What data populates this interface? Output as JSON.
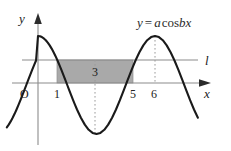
{
  "figure": {
    "title_equation": {
      "lhs": "y",
      "equals": "=",
      "amplitude": "a",
      "function": "cos",
      "frequency": "b",
      "variable": "x",
      "full": "y = a cos bx"
    },
    "axes": {
      "y_axis_label": "y",
      "x_axis_label": "x",
      "origin_label": "O"
    },
    "line_label": "l",
    "tick_labels": [
      {
        "text": "1",
        "x_value": 1
      },
      {
        "text": "5",
        "x_value": 5
      },
      {
        "text": "6",
        "x_value": 6
      }
    ],
    "shaded_region": {
      "value_label": "3",
      "from_x": 1,
      "to_x": 5,
      "fill_color": "#a9a9a9"
    },
    "colors": {
      "curve": "#1a1a1a",
      "axis": "#808080",
      "horizontal_line": "#8a8a8a",
      "dotted_guide": "#999999",
      "background": "#ffffff"
    }
  },
  "chart_data": {
    "type": "line",
    "xlabel": "x",
    "ylabel": "y",
    "function": "y = a*cos(b*x)",
    "amplitude_symbol": "a",
    "frequency_symbol": "b",
    "period": 6,
    "xlim": [
      -1.6,
      8.2
    ],
    "ylim": [
      -1.35,
      1.35
    ],
    "grid": false,
    "legend": "none",
    "x_ticks": [
      1,
      5,
      6
    ],
    "x_tick_labels": [
      "1",
      "5",
      "6"
    ],
    "annotations": [
      {
        "text": "3",
        "x": 3,
        "y": 0.38,
        "note": "width of shaded rectangle region between x=1 and x=5"
      },
      {
        "text": "l",
        "x": 8.0,
        "y": 0.5,
        "note": "horizontal line l at y = a/2 level"
      },
      {
        "text": "O",
        "x": -0.45,
        "y": -0.2,
        "note": "origin label"
      },
      {
        "text": "y = a cos bx",
        "x": 4.6,
        "y": 1.25,
        "note": "curve equation label"
      }
    ],
    "series": [
      {
        "name": "y = a cos bx",
        "x": [
          -1.6,
          -1.5,
          -1.4,
          -1.3,
          -1.2,
          -1.1,
          -1.0,
          -0.9,
          -0.8,
          -0.7,
          -0.6,
          -0.5,
          -0.4,
          -0.3,
          -0.2,
          -0.1,
          0.0,
          0.1,
          0.2,
          0.3,
          0.4,
          0.5,
          0.6,
          0.7,
          0.8,
          0.9,
          1.0,
          1.1,
          1.2,
          1.3,
          1.4,
          1.5,
          1.6,
          1.7,
          1.8,
          1.9,
          2.0,
          2.2,
          2.4,
          2.6,
          2.8,
          3.0,
          3.2,
          3.4,
          3.6,
          3.8,
          4.0,
          4.2,
          4.4,
          4.6,
          4.8,
          5.0,
          5.2,
          5.4,
          5.6,
          5.8,
          6.0,
          6.2,
          6.4,
          6.6,
          6.8,
          7.0,
          7.2,
          7.4,
          7.6,
          7.8,
          8.0,
          8.2
        ],
        "y": [
          -0.866,
          -0.809,
          -0.743,
          -0.669,
          -0.588,
          -0.5,
          -0.407,
          -0.309,
          -0.208,
          -0.105,
          0.0,
          0.105,
          0.208,
          0.309,
          0.407,
          0.5,
          1.0,
          0.995,
          0.978,
          0.951,
          0.914,
          0.866,
          0.809,
          0.743,
          0.669,
          0.588,
          0.5,
          0.407,
          0.309,
          0.208,
          0.105,
          0.0,
          -0.105,
          -0.208,
          -0.309,
          -0.407,
          -0.5,
          -0.669,
          -0.809,
          -0.914,
          -0.978,
          -1.0,
          -0.978,
          -0.914,
          -0.809,
          -0.669,
          -0.5,
          -0.309,
          -0.105,
          0.105,
          0.309,
          0.5,
          0.669,
          0.809,
          0.914,
          0.978,
          1.0,
          0.978,
          0.914,
          0.809,
          0.669,
          0.5,
          0.309,
          0.105,
          -0.105,
          -0.309,
          -0.5,
          -0.669
        ],
        "note": "cosine with period 6, peaks at x=0 and x=6, trough at x=3"
      }
    ],
    "horizontal_line": {
      "y": 0.5,
      "label": "l"
    },
    "shaded_rectangle": {
      "x_from": 1,
      "x_to": 5,
      "y_from": 0,
      "y_to": 0.5,
      "label": "3"
    },
    "dotted_guides": [
      {
        "x": 3,
        "from_y": 0.5,
        "to_y": -1.0
      },
      {
        "x": 6,
        "from_y": 1.0,
        "to_y": 0.0
      }
    ]
  }
}
